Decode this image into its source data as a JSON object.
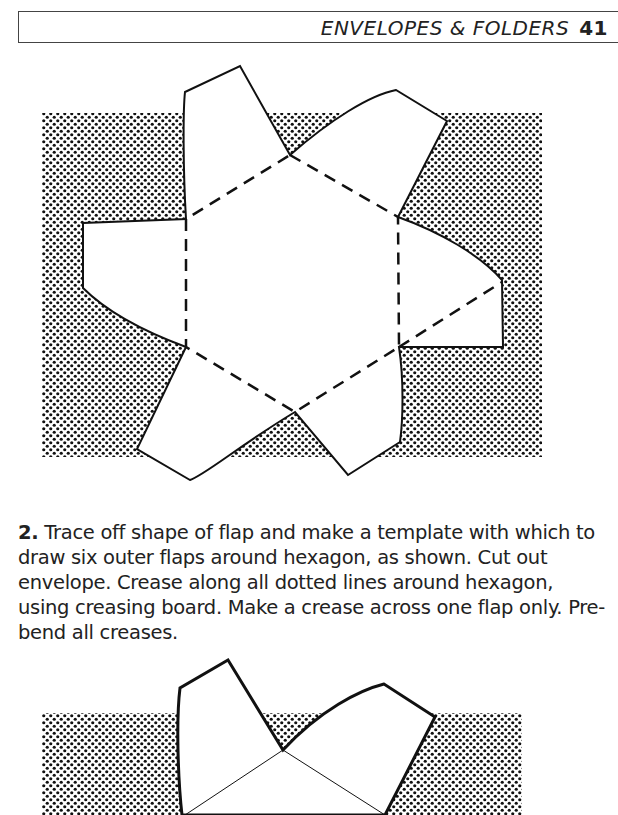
{
  "header": {
    "section_title": "ENVELOPES & FOLDERS",
    "page_number": "41"
  },
  "figure_1": {
    "description": "Hexagonal envelope template with six outer flaps on dotted background; dashed crease lines around hexagon",
    "fold_lines": "dashed"
  },
  "instructions": {
    "step_number": "2.",
    "text": "Trace off shape of flap and make a template with which to draw six outer flaps around hexagon, as shown. Cut out envelope. Crease along all dotted lines around hexagon, using creasing board. Make a crease across one flap only. Pre-bend all creases."
  },
  "figure_2": {
    "description": "Partial view of envelope with two upper flaps and thin crease lines on dotted background"
  },
  "colors": {
    "ink": "#1a1a1a",
    "paper": "#ffffff"
  }
}
